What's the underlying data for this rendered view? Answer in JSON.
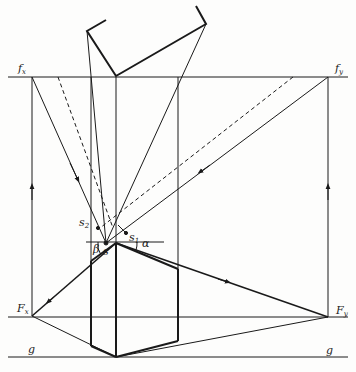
{
  "diagram": {
    "type": "two-point-perspective-construction",
    "labels": {
      "fx": {
        "main": "f",
        "sub": "x"
      },
      "fy": {
        "main": "f",
        "sub": "y"
      },
      "Fx": {
        "main": "F",
        "sub": "x"
      },
      "Fy": {
        "main": "F",
        "sub": "y"
      },
      "s": {
        "main": "s",
        "sub": ""
      },
      "s1": {
        "main": "s",
        "sub": "1"
      },
      "s2": {
        "main": "s",
        "sub": "2"
      },
      "g_left": {
        "main": "g",
        "sub": ""
      },
      "g_right": {
        "main": "g",
        "sub": ""
      },
      "alpha": {
        "main": "α",
        "sub": ""
      },
      "beta": {
        "main": "β",
        "sub": ""
      }
    },
    "colors": {
      "line": "#1a1a1a",
      "background": "#fdfdfc"
    }
  }
}
